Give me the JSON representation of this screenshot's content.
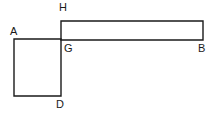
{
  "figure": {
    "kind": "geometry-diagram",
    "canvas": {
      "width": 214,
      "height": 118
    },
    "background_color": "#ffffff",
    "stroke_color": "#1a1a1a",
    "label_color": "#1a1a1a",
    "shapes": [
      {
        "name": "horizontal-rectangle",
        "type": "rectangle",
        "points": "61,21 203,21 203,40 61,40",
        "x": 61,
        "y": 21,
        "width": 142,
        "height": 19
      },
      {
        "name": "left-square",
        "type": "rectangle",
        "points": "14,39 61,39 61,96 14,96",
        "x": 14,
        "y": 39,
        "width": 47,
        "height": 57
      }
    ],
    "labels": [
      {
        "id": "A",
        "text": "A",
        "x": 10,
        "y": 26
      },
      {
        "id": "H",
        "text": "H",
        "x": 59,
        "y": 2
      },
      {
        "id": "G",
        "text": "G",
        "x": 64,
        "y": 43
      },
      {
        "id": "B",
        "text": "B",
        "x": 198,
        "y": 43
      },
      {
        "id": "D",
        "text": "D",
        "x": 56,
        "y": 99
      }
    ]
  }
}
